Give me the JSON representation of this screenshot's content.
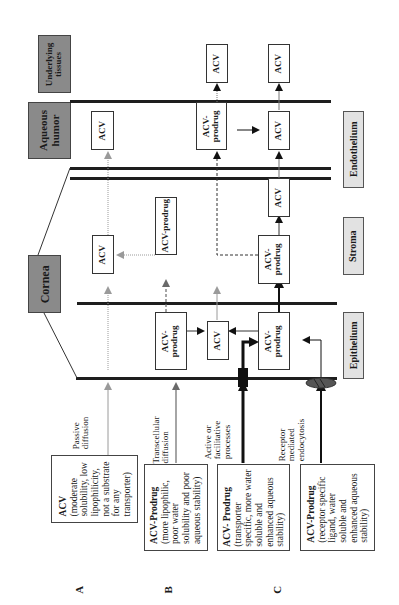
{
  "figure": {
    "orientation": "rotated 90 degrees counter-clockwise",
    "regions": {
      "underlying_tissues": "Underlying tissues",
      "aqueous_humor": "Aqueous humor",
      "cornea": "Cornea"
    },
    "layers": {
      "endothelium": "Endothelium",
      "stroma": "Stroma",
      "epithelium": "Epithelium"
    },
    "species": {
      "acv": "ACV",
      "acv_prodrug": "ACV-prodrug",
      "acv_prodrug_split": "ACV-",
      "prodrug_word": "prodrug"
    },
    "routes": [
      {
        "label_line1": "Passive",
        "label_line2": "diffusion"
      },
      {
        "label_line1": "Transcellular",
        "label_line2": "diffusion"
      },
      {
        "label_line1": "Active or",
        "label_line2": "facilitative",
        "label_line3": "processes"
      },
      {
        "label_line1": "Receptor",
        "label_line2": "mediated",
        "label_line3": "endocytosis"
      }
    ],
    "descriptions": [
      {
        "title": "ACV",
        "lines": [
          "(moderate",
          "solubility, low",
          "lipophilicity,",
          "not a substrate",
          "for any",
          "transporter)"
        ]
      },
      {
        "title": "ACV-Prodrug",
        "lines": [
          "(more lipophilic,",
          "poor  water",
          "solubility and poor",
          "aqueous stability)"
        ]
      },
      {
        "title": "ACV- Prodrug",
        "lines": [
          "(transporter",
          "specific, more water",
          "soluble and",
          "enhanced aqueous",
          "stability)"
        ]
      },
      {
        "title": "ACV-Prodrug",
        "lines": [
          "(receptor specific",
          "ligand,  water",
          "soluble and",
          "enhanced aqueous",
          "stability)"
        ]
      }
    ],
    "panel_labels": [
      "A",
      "B",
      "C"
    ],
    "colors": {
      "region_box": "#8a8a8a",
      "layer_box": "#e2e2e2",
      "membrane": "#1e1e1e",
      "faint_arrow": "#9a9a9a",
      "transporter": "#111111",
      "receptor": "#555555"
    }
  }
}
